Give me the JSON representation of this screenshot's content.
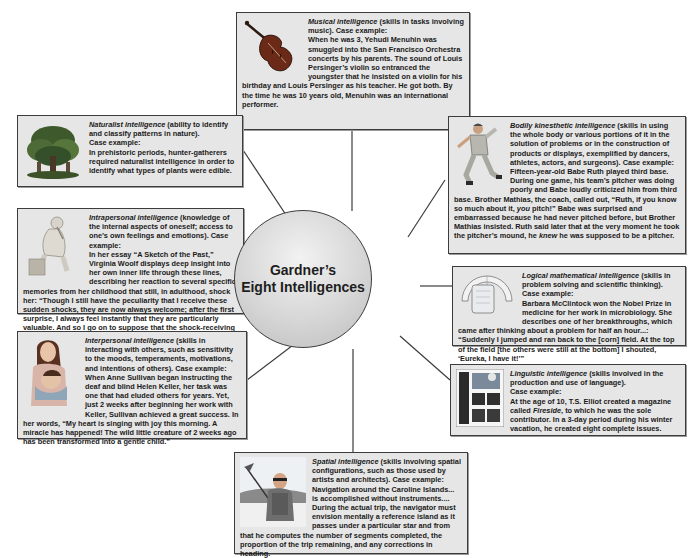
{
  "title": {
    "line1": "Gardner’s",
    "line2": "Eight Intelligences"
  },
  "boxes": {
    "musical": {
      "name": "Musical intelligence",
      "definition": " (skills in tasks involving music). Case example:",
      "example": "When he was 3, Yehudi Menuhin was smuggled into the San Francisco Orchestra concerts by his parents. The sound of Louis Persinger’s violin so entranced the youngster that he insisted on a violin for his birthday and Louis Persinger as his teacher. He got both. By the time he was 10 years old, Menuhin was an international performer.",
      "icon": "violin-icon"
    },
    "naturalist": {
      "name": "Naturalist intelligence",
      "definition": " (ability to identify and classify patterns in nature).",
      "case_label": "Case example:",
      "example": "In prehistoric periods, hunter-gatherers required naturalist intelligence in order to identify what types of plants were edible.",
      "icon": "tree-icon"
    },
    "bodily": {
      "name": "Bodily kinesthetic intelligence",
      "definition": " (skills in using the whole body or various portions of it in the solution of problems or in the construction of products or displays, exemplified by dancers, athletes, actors, and surgeons). Case example:",
      "example_a": "Fifteen-year-old Babe Ruth played third base. During one game, his team’s pitcher was doing poorly and Babe loudly criticized him from third base. Brother Mathias, the coach, called out, “Ruth, if you know so much about it, ",
      "example_italic": "you",
      "example_b": " pitch!” Babe was surprised and embarrassed because he had never pitched before, but Brother Mathias insisted. Ruth said later that at the very moment he took the pitcher’s mound, he ",
      "example_italic2": "knew",
      "example_c": " he was supposed to be a pitcher.",
      "icon": "baseball-pitcher-icon"
    },
    "intrapersonal": {
      "name": "Intrapersonal intelligence",
      "definition": " (knowledge of the internal aspects of oneself; access to one’s own feelings and emotions). Case example:",
      "example": "In her essay “A Sketch of the Past,” Virginia Woolf displays deep insight into her own inner life through these lines, describing her reaction to several specific memories from her childhood that still, in adulthood, shock her: “Though I still have the peculiarity that I receive these sudden shocks, they are now always welcome; after the first surprise, I always feel instantly that they are particularly valuable. And so I go on to suppose that the shock-receiving capacity is what makes me a writer.”",
      "icon": "thinker-statue-icon"
    },
    "logical": {
      "name": "Logical mathematical intelligence",
      "definition": " (skills in problem solving and scientific thinking).",
      "case_label": "Case example:",
      "example": "Barbara McClintock won the Nobel Prize in medicine for her work in microbiology. She describes one of her breakthroughs, which came after thinking about a problem for half an hour...: “Suddenly I jumped and ran back to the [corn] field. At the top of the field [the others were still at the bottom] I shouted, ‘Eureka, I have it!’”",
      "icon": "lab-equipment-icon"
    },
    "interpersonal": {
      "name": "Interpersonal intelligence",
      "definition": " (skills in interacting with others, such as sensitivity to the moods, temperaments, motivations, and intentions of others). Case example:",
      "example": "When Anne Sullivan began instructing the deaf and blind Helen Keller, her task was one that had eluded others for years. Yet, just 2 weeks after beginning her work with Keller, Sullivan achieved a great success. In her words, “My heart is singing with joy this morning. A miracle has happened! The wild little creature of 2 weeks ago has been transformed into a gentle child.”",
      "icon": "mother-child-icon"
    },
    "linguistic": {
      "name": "Linguistic intelligence",
      "definition": " (skills involved in the production and use of language).",
      "case_label": "Case example:",
      "example_a": "At the age of 10, T.S. Elliot created a magazine called ",
      "example_italic": "Fireside",
      "example_b": ", to which he was the sole contributor. In a 3-day period during his winter vacation, he created eight complete issues.",
      "icon": "magazine-page-icon"
    },
    "spatial": {
      "name": "Spatial intelligence",
      "definition": " (skills involving spatial configurations, such as those used by artists and architects). Case example:",
      "example": "Navigation around the Caroline Islands... is accomplished without instruments.... During the actual trip, the navigator must envision mentally a reference island as it passes under a particular star and from that he computes the number of segments completed, the proportion of the trip remaining, and any corrections in heading.",
      "icon": "sailor-navigator-icon"
    }
  },
  "colors": {
    "box_fill": "#e6e6e6",
    "border": "#3c3c3c",
    "text": "#1a1a1a",
    "hub_fill": "#d6d6d6"
  }
}
